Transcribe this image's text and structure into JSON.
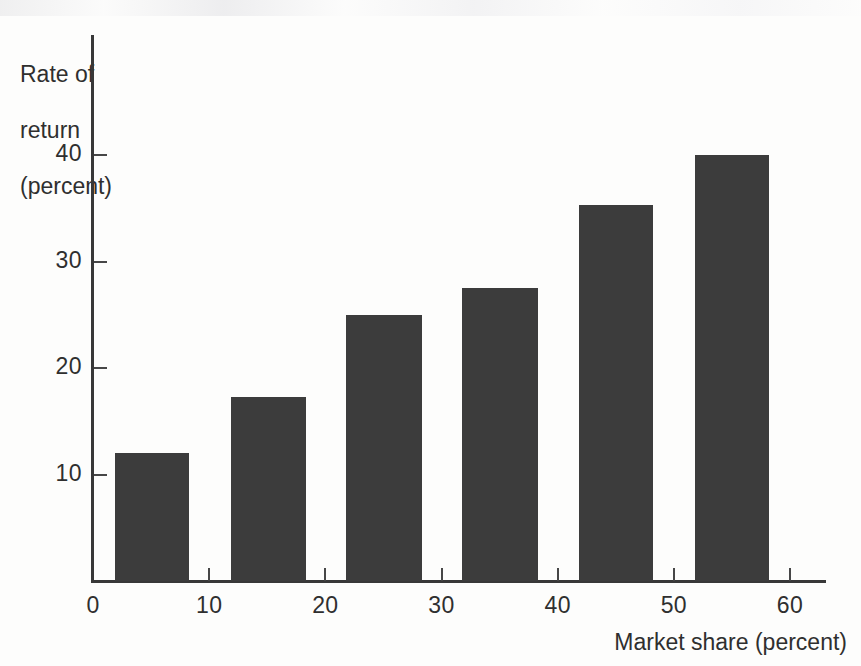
{
  "chart_data": {
    "type": "bar",
    "title": "",
    "subtitle": "",
    "xlabel": "Market share (percent)",
    "ylabel": "Rate of\nreturn\n(percent)",
    "ylabel_lines": [
      "Rate of",
      "return",
      "(percent)"
    ],
    "xlim": [
      0,
      63.2
    ],
    "ylim": [
      0,
      47
    ],
    "grid": false,
    "legend": null,
    "x_ticks": [
      0,
      10,
      20,
      30,
      40,
      50,
      60
    ],
    "x_tick_labels": [
      "0",
      "10",
      "20",
      "30",
      "40",
      "50",
      "60"
    ],
    "y_ticks": [
      10,
      20,
      30,
      40
    ],
    "y_tick_labels": [
      "10",
      "20",
      "30",
      "40"
    ],
    "bar_color": "#3c3c3c",
    "background_color": "#fdfdfc",
    "axis_color": "#383838",
    "categories": [
      "0-10",
      "10-20",
      "20-30",
      "30-40",
      "40-50",
      "50-60"
    ],
    "bar_spans": [
      {
        "x_start": 1.9,
        "x_end": 8.3
      },
      {
        "x_start": 11.9,
        "x_end": 18.3
      },
      {
        "x_start": 21.8,
        "x_end": 28.3
      },
      {
        "x_start": 31.8,
        "x_end": 38.3
      },
      {
        "x_start": 41.8,
        "x_end": 48.2
      },
      {
        "x_start": 51.8,
        "x_end": 58.2
      }
    ],
    "values": [
      12,
      17.3,
      25,
      27.5,
      35.3,
      40
    ],
    "series": [
      {
        "name": "Rate of return",
        "values": [
          12,
          17.3,
          25,
          27.5,
          35.3,
          40
        ]
      }
    ],
    "value_labels": [
      "12",
      "17.3",
      "25",
      "27.5",
      "35.3",
      "40"
    ]
  },
  "axes": {
    "y_title_line1": "Rate of",
    "y_title_line2": "return",
    "y_title_line3": "(percent)",
    "x_title": "Market share (percent)"
  }
}
